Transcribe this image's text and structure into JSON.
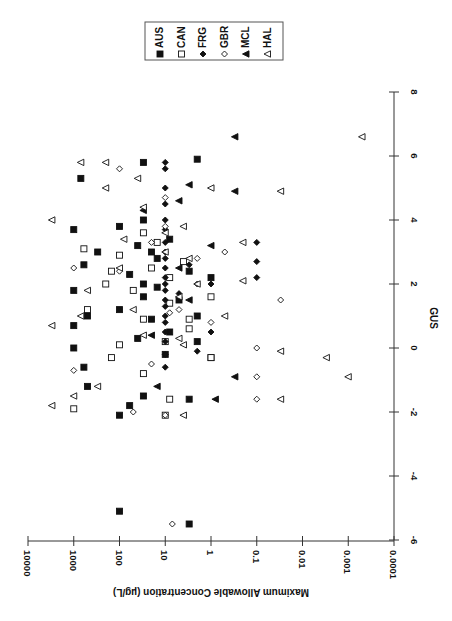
{
  "chart_data": {
    "type": "scatter",
    "title": "",
    "orientation_note": "figure rotated 90 degrees clockwise on page",
    "xlabel": "GUS",
    "ylabel": "Maximum Allowable Concentration (µg/L)",
    "xlim": [
      -6,
      8
    ],
    "ylim": [
      0.0001,
      10000
    ],
    "yscale": "log",
    "x_ticks": [
      "-6",
      "-4",
      "-2",
      "0",
      "2",
      "4",
      "6",
      "8"
    ],
    "y_ticks": [
      "10000",
      "1000",
      "100",
      "10",
      "1",
      "0.1",
      "0.01",
      "0.001",
      "0.0001"
    ],
    "grid": false,
    "legend_position": "top-right (rotated)",
    "legend": [
      {
        "name": "AUS",
        "marker": "filled-square"
      },
      {
        "name": "CAN",
        "marker": "open-square"
      },
      {
        "name": "FRG",
        "marker": "filled-diamond"
      },
      {
        "name": "GBR",
        "marker": "open-diamond"
      },
      {
        "name": "MCL",
        "marker": "filled-triangle"
      },
      {
        "name": "HAL",
        "marker": "open-triangle"
      }
    ],
    "series": [
      {
        "name": "AUS",
        "marker": "filled-square",
        "points": [
          [
            -5.1,
            100
          ],
          [
            -5.5,
            3
          ],
          [
            5.9,
            2
          ],
          [
            5.8,
            30
          ],
          [
            5.3,
            700
          ],
          [
            4.0,
            30
          ],
          [
            3.8,
            100
          ],
          [
            3.7,
            1000
          ],
          [
            3.4,
            8
          ],
          [
            3.2,
            40
          ],
          [
            3.0,
            300
          ],
          [
            2.8,
            15
          ],
          [
            2.6,
            600
          ],
          [
            2.4,
            3
          ],
          [
            2.3,
            60
          ],
          [
            2.2,
            1
          ],
          [
            1.9,
            15
          ],
          [
            1.8,
            1000
          ],
          [
            1.6,
            30
          ],
          [
            1.5,
            5
          ],
          [
            1.2,
            100
          ],
          [
            1.0,
            2
          ],
          [
            0.9,
            20
          ],
          [
            0.7,
            1000
          ],
          [
            0.5,
            8
          ],
          [
            0.3,
            40
          ],
          [
            0.2,
            2
          ],
          [
            0.0,
            1000
          ],
          [
            -0.2,
            10
          ],
          [
            -0.3,
            1
          ],
          [
            -0.6,
            600
          ],
          [
            -1.2,
            500
          ],
          [
            -1.5,
            30
          ],
          [
            -1.6,
            3
          ],
          [
            -1.8,
            60
          ],
          [
            -2.1,
            100
          ],
          [
            2.0,
            30
          ],
          [
            3.0,
            20
          ],
          [
            1.0,
            500
          ]
        ]
      },
      {
        "name": "CAN",
        "marker": "open-square",
        "points": [
          [
            -1.9,
            1000
          ],
          [
            -1.6,
            8
          ],
          [
            -0.8,
            30
          ],
          [
            -0.3,
            150
          ],
          [
            0.1,
            100
          ],
          [
            0.2,
            10
          ],
          [
            0.6,
            3
          ],
          [
            0.9,
            30
          ],
          [
            1.2,
            500
          ],
          [
            1.4,
            8
          ],
          [
            1.6,
            1
          ],
          [
            1.8,
            50
          ],
          [
            2.0,
            200
          ],
          [
            2.2,
            8
          ],
          [
            2.4,
            150
          ],
          [
            2.5,
            20
          ],
          [
            2.7,
            4
          ],
          [
            2.9,
            100
          ],
          [
            3.1,
            600
          ],
          [
            3.3,
            15
          ],
          [
            3.6,
            30
          ],
          [
            -0.3,
            1
          ],
          [
            0.9,
            3
          ],
          [
            -2.1,
            10
          ]
        ]
      },
      {
        "name": "FRG",
        "marker": "filled-diamond",
        "points": [
          [
            5.8,
            10
          ],
          [
            5.6,
            10
          ],
          [
            5.0,
            10
          ],
          [
            4.5,
            10
          ],
          [
            4.0,
            10
          ],
          [
            3.7,
            10
          ],
          [
            3.3,
            10
          ],
          [
            3.0,
            10
          ],
          [
            2.8,
            10
          ],
          [
            2.5,
            10
          ],
          [
            2.2,
            10
          ],
          [
            2.0,
            10
          ],
          [
            1.8,
            10
          ],
          [
            1.5,
            10
          ],
          [
            1.3,
            10
          ],
          [
            1.0,
            10
          ],
          [
            0.8,
            10
          ],
          [
            0.5,
            10
          ],
          [
            0.2,
            10
          ],
          [
            -0.2,
            10
          ],
          [
            -0.6,
            10
          ],
          [
            3.3,
            0.1
          ],
          [
            2.7,
            0.1
          ],
          [
            2.2,
            0.1
          ],
          [
            2.0,
            1
          ],
          [
            2.6,
            3
          ],
          [
            1.7,
            5
          ],
          [
            0.5,
            1
          ],
          [
            -0.1,
            2
          ]
        ]
      },
      {
        "name": "GBR",
        "marker": "open-diamond",
        "points": [
          [
            -5.5,
            7
          ],
          [
            5.6,
            100
          ],
          [
            4.7,
            10
          ],
          [
            3.8,
            10
          ],
          [
            3.3,
            20
          ],
          [
            3.0,
            0.5
          ],
          [
            2.8,
            2
          ],
          [
            2.5,
            1000
          ],
          [
            2.0,
            2
          ],
          [
            1.5,
            0.03
          ],
          [
            1.1,
            8
          ],
          [
            0.8,
            1
          ],
          [
            0.0,
            0.1
          ],
          [
            -0.5,
            20
          ],
          [
            -0.7,
            1000
          ],
          [
            -0.9,
            0.1
          ],
          [
            -1.6,
            0.1
          ],
          [
            -2.0,
            50
          ],
          [
            -2.1,
            10
          ],
          [
            1.2,
            5
          ],
          [
            2.4,
            100
          ]
        ]
      },
      {
        "name": "MCL",
        "marker": "filled-triangle",
        "points": [
          [
            6.6,
            0.3
          ],
          [
            5.1,
            3
          ],
          [
            4.9,
            0.3
          ],
          [
            4.6,
            5
          ],
          [
            4.3,
            30
          ],
          [
            3.2,
            1
          ],
          [
            1.5,
            3
          ],
          [
            0.4,
            20
          ],
          [
            -0.9,
            0.3
          ],
          [
            -1.2,
            15
          ],
          [
            -1.6,
            0.8
          ],
          [
            2.5,
            5
          ]
        ]
      },
      {
        "name": "HAL",
        "marker": "open-triangle",
        "points": [
          [
            6.6,
            0.0005
          ],
          [
            5.8,
            700
          ],
          [
            5.8,
            200
          ],
          [
            5.3,
            40
          ],
          [
            5.0,
            200
          ],
          [
            5.0,
            1
          ],
          [
            4.9,
            0.03
          ],
          [
            4.4,
            30
          ],
          [
            4.0,
            3000
          ],
          [
            3.8,
            4
          ],
          [
            3.6,
            10
          ],
          [
            3.4,
            80
          ],
          [
            3.3,
            0.2
          ],
          [
            3.0,
            10
          ],
          [
            2.8,
            3
          ],
          [
            2.5,
            100
          ],
          [
            2.1,
            0.2
          ],
          [
            2.0,
            2
          ],
          [
            1.8,
            500
          ],
          [
            1.6,
            5
          ],
          [
            1.2,
            50
          ],
          [
            1.0,
            0.5
          ],
          [
            0.7,
            3000
          ],
          [
            0.4,
            30
          ],
          [
            0.1,
            4
          ],
          [
            -0.1,
            0.03
          ],
          [
            -0.3,
            0.003
          ],
          [
            -0.9,
            0.001
          ],
          [
            -1.2,
            300
          ],
          [
            -1.5,
            1000
          ],
          [
            -1.6,
            0.03
          ],
          [
            -1.8,
            3000
          ],
          [
            -2.1,
            4
          ],
          [
            1.0,
            700
          ],
          [
            0.3,
            5
          ]
        ]
      }
    ]
  }
}
